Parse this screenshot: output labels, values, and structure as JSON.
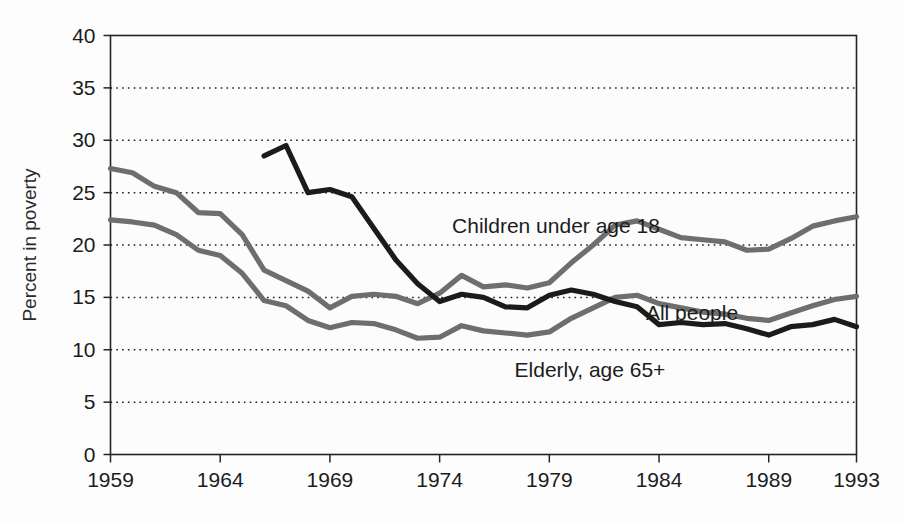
{
  "chart_data": {
    "type": "line",
    "title": "",
    "xlabel": "",
    "ylabel": "Percent in poverty",
    "ylim": [
      0,
      40
    ],
    "xlim": [
      1959,
      1993
    ],
    "yticks": [
      0,
      5,
      10,
      15,
      20,
      25,
      30,
      35,
      40
    ],
    "xticks": [
      1959,
      1964,
      1969,
      1974,
      1979,
      1984,
      1989,
      1993
    ],
    "grid": "horizontal-dotted",
    "legend_position": "inline-annotations",
    "series": [
      {
        "name": "Children under age 18",
        "color": "#6e6e6e",
        "label_text": "Children under age 18",
        "x": [
          1959,
          1960,
          1961,
          1962,
          1963,
          1964,
          1965,
          1966,
          1967,
          1968,
          1969,
          1970,
          1971,
          1972,
          1973,
          1974,
          1975,
          1976,
          1977,
          1978,
          1979,
          1980,
          1981,
          1982,
          1983,
          1984,
          1985,
          1986,
          1987,
          1988,
          1989,
          1990,
          1991,
          1992,
          1993
        ],
        "values": [
          27.3,
          26.9,
          25.6,
          25.0,
          23.1,
          23.0,
          21.0,
          17.6,
          16.6,
          15.6,
          14.0,
          15.1,
          15.3,
          15.1,
          14.4,
          15.4,
          17.1,
          16.0,
          16.2,
          15.9,
          16.4,
          18.3,
          20.0,
          21.9,
          22.3,
          21.5,
          20.7,
          20.5,
          20.3,
          19.5,
          19.6,
          20.6,
          21.8,
          22.3,
          22.7
        ]
      },
      {
        "name": "All people",
        "color": "#6e6e6e",
        "label_text": "All people",
        "x": [
          1959,
          1960,
          1961,
          1962,
          1963,
          1964,
          1965,
          1966,
          1967,
          1968,
          1969,
          1970,
          1971,
          1972,
          1973,
          1974,
          1975,
          1976,
          1977,
          1978,
          1979,
          1980,
          1981,
          1982,
          1983,
          1984,
          1985,
          1986,
          1987,
          1988,
          1989,
          1990,
          1991,
          1992,
          1993
        ],
        "values": [
          22.4,
          22.2,
          21.9,
          21.0,
          19.5,
          19.0,
          17.3,
          14.7,
          14.2,
          12.8,
          12.1,
          12.6,
          12.5,
          11.9,
          11.1,
          11.2,
          12.3,
          11.8,
          11.6,
          11.4,
          11.7,
          13.0,
          14.0,
          15.0,
          15.2,
          14.4,
          14.0,
          13.6,
          13.4,
          13.0,
          12.8,
          13.5,
          14.2,
          14.8,
          15.1
        ]
      },
      {
        "name": "Elderly, age 65+",
        "color": "#1b1b1b",
        "label_text": "Elderly, age 65+",
        "x": [
          1966,
          1967,
          1968,
          1969,
          1970,
          1971,
          1972,
          1973,
          1974,
          1975,
          1976,
          1977,
          1978,
          1979,
          1980,
          1981,
          1982,
          1983,
          1984,
          1985,
          1986,
          1987,
          1988,
          1989,
          1990,
          1991,
          1992,
          1993
        ],
        "values": [
          28.5,
          29.5,
          25.0,
          25.3,
          24.6,
          21.6,
          18.6,
          16.3,
          14.6,
          15.3,
          15.0,
          14.1,
          14.0,
          15.2,
          15.7,
          15.3,
          14.6,
          14.1,
          12.4,
          12.6,
          12.4,
          12.5,
          12.0,
          11.4,
          12.2,
          12.4,
          12.9,
          12.2
        ]
      }
    ],
    "annotations": [
      {
        "text": "Children under age 18",
        "x_px": 556,
        "y_px": 233
      },
      {
        "text": "All people",
        "x_px": 692,
        "y_px": 320
      },
      {
        "text": "Elderly, age 65+",
        "x_px": 590,
        "y_px": 377
      }
    ]
  },
  "axes": {
    "y_title": "Percent in poverty",
    "y_tick_labels": [
      "40",
      "35",
      "30",
      "25",
      "20",
      "15",
      "10",
      "5",
      "0"
    ],
    "x_tick_labels": [
      "1959",
      "1964",
      "1969",
      "1974",
      "1979",
      "1984",
      "1989",
      "1993"
    ]
  },
  "colors": {
    "line_gray": "#6e6e6e",
    "line_black": "#1b1b1b",
    "frame": "#242424",
    "grid": "#1f1f1f",
    "background": "#fdfdfd"
  }
}
